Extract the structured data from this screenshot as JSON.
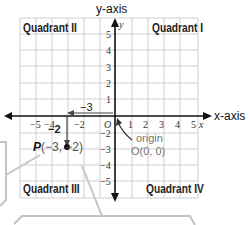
{
  "diagram": {
    "x_axis_label": "x-axis",
    "y_axis_label": "y-axis",
    "x_var": "x",
    "y_var": "y",
    "quadrants": {
      "q1": "Quadrant I",
      "q2": "Quadrant II",
      "q3": "Quadrant III",
      "q4": "Quadrant IV"
    },
    "x_ticks": [
      "−5",
      "−4",
      "−2",
      "1",
      "2",
      "3",
      "4",
      "5"
    ],
    "y_ticks": [
      "5",
      "4",
      "3",
      "2",
      "1",
      "−2",
      "−3",
      "−4",
      "−5"
    ],
    "origin_tick": "O",
    "origin_label": "origin",
    "origin_coords": "O(0, 0)",
    "point": {
      "name": "P",
      "label": "P(−3, −2)",
      "x": -3,
      "y": -2,
      "x_move_label": "−3",
      "y_move_label": "−2"
    },
    "colors": {
      "grid": "#c8c8c8",
      "axis": "#111111",
      "callout": "#bdbdbd",
      "text_gray": "#777777"
    }
  }
}
